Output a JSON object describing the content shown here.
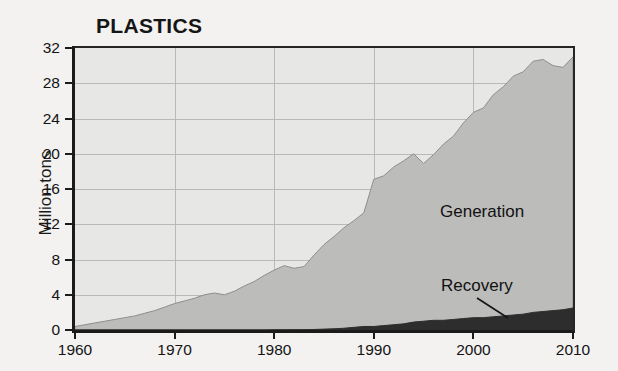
{
  "chart_data": {
    "type": "area",
    "title": "PLASTICS",
    "xlabel": "",
    "ylabel": "Million tons",
    "xlim": [
      1960,
      2010
    ],
    "ylim": [
      0,
      32
    ],
    "grid": true,
    "legend_position": "inline-annotations",
    "stacked": false,
    "x_ticks": [
      "1960",
      "1970",
      "1980",
      "1990",
      "2000",
      "2010"
    ],
    "x_tick_values": [
      1960,
      1970,
      1980,
      1990,
      2000,
      2010
    ],
    "y_ticks": [
      "0",
      "4",
      "8",
      "12",
      "16",
      "20",
      "24",
      "28",
      "32"
    ],
    "y_tick_values": [
      0,
      4,
      8,
      12,
      16,
      20,
      24,
      28,
      32
    ],
    "x": [
      1960,
      1961,
      1962,
      1963,
      1964,
      1965,
      1966,
      1967,
      1968,
      1969,
      1970,
      1971,
      1972,
      1973,
      1974,
      1975,
      1976,
      1977,
      1978,
      1979,
      1980,
      1981,
      1982,
      1983,
      1984,
      1985,
      1986,
      1987,
      1988,
      1989,
      1990,
      1991,
      1992,
      1993,
      1994,
      1995,
      1996,
      1997,
      1998,
      1999,
      2000,
      2001,
      2002,
      2003,
      2004,
      2005,
      2006,
      2007,
      2008,
      2009,
      2010
    ],
    "series": [
      {
        "name": "Generation",
        "color": "#bcbcba",
        "values": [
          0.4,
          0.6,
          0.8,
          1.0,
          1.2,
          1.4,
          1.6,
          1.9,
          2.2,
          2.6,
          3.0,
          3.3,
          3.6,
          4.0,
          4.2,
          4.0,
          4.4,
          5.0,
          5.5,
          6.2,
          6.8,
          7.3,
          7.0,
          7.2,
          8.5,
          9.7,
          10.6,
          11.6,
          12.4,
          13.3,
          17.1,
          17.5,
          18.5,
          19.2,
          20.0,
          18.9,
          19.9,
          21.1,
          22.0,
          23.5,
          24.7,
          25.2,
          26.7,
          27.6,
          28.8,
          29.3,
          30.5,
          30.7,
          30.0,
          29.8,
          31.0
        ]
      },
      {
        "name": "Recovery",
        "color": "#2d2d2d",
        "values": [
          0.0,
          0.0,
          0.0,
          0.0,
          0.0,
          0.0,
          0.0,
          0.0,
          0.0,
          0.0,
          0.0,
          0.0,
          0.0,
          0.0,
          0.0,
          0.0,
          0.0,
          0.0,
          0.0,
          0.0,
          0.02,
          0.02,
          0.03,
          0.04,
          0.06,
          0.1,
          0.14,
          0.2,
          0.3,
          0.4,
          0.4,
          0.5,
          0.6,
          0.7,
          0.9,
          1.0,
          1.1,
          1.1,
          1.2,
          1.3,
          1.4,
          1.4,
          1.5,
          1.6,
          1.7,
          1.8,
          2.0,
          2.1,
          2.2,
          2.3,
          2.5
        ]
      }
    ],
    "annotations": [
      {
        "text": "Generation",
        "series": "Generation"
      },
      {
        "text": "Recovery",
        "series": "Recovery",
        "has_leader_line": true
      }
    ]
  },
  "style": {
    "background": "#f3f2f0",
    "plot_background": "#e7e7e5",
    "gridline_color": "#b9b9b7",
    "axis_color": "#1b1b1b",
    "generation_fill": "#bcbcba",
    "recovery_fill": "#2d2d2d"
  }
}
